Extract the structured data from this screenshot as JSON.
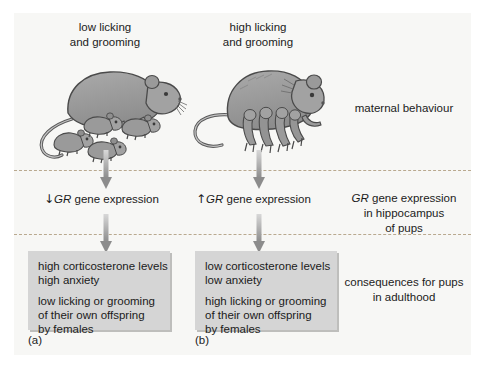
{
  "figure": {
    "columns": {
      "left": {
        "heading": "low licking\nand grooming",
        "gene_direction": "↓",
        "gene_text_pre": "GR",
        "gene_text_post": " gene expression",
        "caption": "(a)",
        "outcomes": [
          "high corticosterone levels",
          "high anxiety",
          "low licking or grooming",
          "of their own offspring",
          "by females"
        ]
      },
      "right": {
        "heading": "high licking\nand grooming",
        "gene_direction": "↑",
        "gene_text_pre": "GR",
        "gene_text_post": " gene expression",
        "caption": "(b)",
        "outcomes": [
          "low corticosterone levels",
          "low anxiety",
          "high licking or grooming",
          "of their own offspring",
          "by females"
        ]
      }
    },
    "band_labels": {
      "maternal_behaviour": "maternal behaviour",
      "gene_expression_pre": "GR",
      "gene_expression_post": " gene expression\nin hippocampus\nof pups",
      "consequences": "consequences for pups\nin adulthood"
    },
    "colors": {
      "panel_background": "#f7f7f5",
      "divider": "#b9a98f",
      "outcome_box": "#d5d5d5",
      "arrow_dark": "#8c8c8c",
      "arrow_light": "#cfcfcf",
      "text": "#1b1b1b",
      "rat_body": "#9a9a9a",
      "rat_outline": "#4a4a4a"
    }
  }
}
